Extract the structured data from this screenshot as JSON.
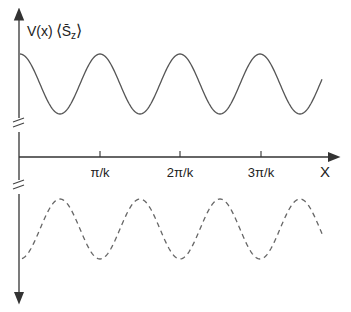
{
  "figure": {
    "y_label": "V(x) ⟨S̄z⟩",
    "y_label_main": "V(x)",
    "y_label_bracket_left": "⟨",
    "y_label_s": "S̄",
    "y_label_sub": "z",
    "y_label_bracket_right": "⟩",
    "x_label": "X",
    "x_ticks": [
      "π/k",
      "2π/k",
      "3π/k"
    ],
    "colors": {
      "line": "#555555",
      "axis": "#333333",
      "background": "#ffffff"
    }
  },
  "chart_data": {
    "type": "line",
    "title": "",
    "xlabel": "X",
    "ylabel": "V(x) ⟨S̄z⟩",
    "x_tick_labels": [
      "π/k",
      "2π/k",
      "3π/k"
    ],
    "x_tick_values_in_pi_over_k": [
      1,
      2,
      3
    ],
    "x_range_in_pi_over_k": [
      0,
      3.8
    ],
    "series": [
      {
        "name": "V(x)",
        "style": "solid",
        "function": "cos(2kx)",
        "position": "above axis (offset, broken axis)",
        "starts_at": "maximum"
      },
      {
        "name": "⟨S̄z⟩",
        "style": "dashed",
        "function": "-cos(2kx)",
        "position": "below axis (offset, broken axis)",
        "starts_at": "minimum"
      }
    ],
    "axis_breaks": [
      "between V(x) curve and x-axis",
      "between x-axis and ⟨S̄z⟩ curve"
    ],
    "grid": false,
    "legend": "none"
  }
}
